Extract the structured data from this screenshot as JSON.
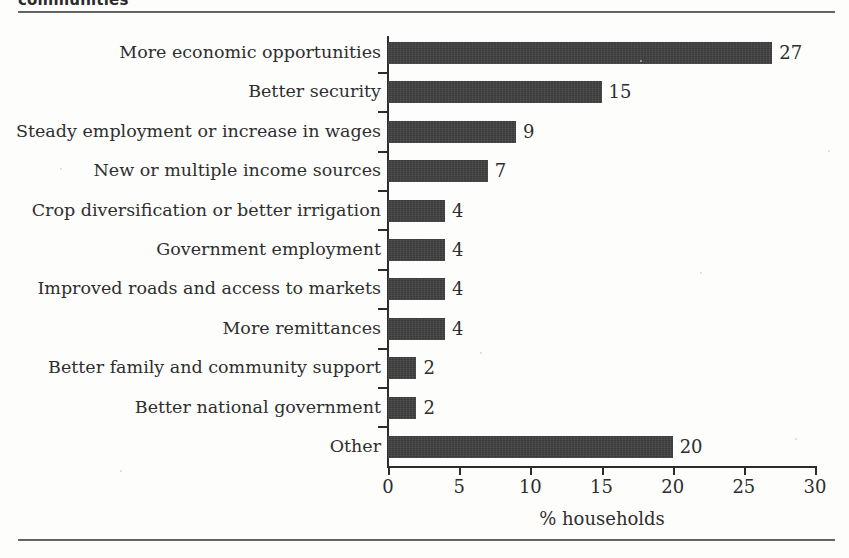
{
  "caption": {
    "text_cropped": "communities"
  },
  "chart_data": {
    "type": "bar",
    "orientation": "horizontal",
    "title": "",
    "subtitle": "",
    "xlabel": "% households",
    "ylabel": "",
    "xlim": [
      0,
      30
    ],
    "xticks": [
      0,
      5,
      10,
      15,
      20,
      25,
      30
    ],
    "xticklabels": [
      "0",
      "5",
      "10",
      "15",
      "20",
      "25",
      "30"
    ],
    "grid": false,
    "legend": null,
    "bar_color": "#3b3b3b",
    "text_color": "#2e2e2e",
    "value_labels_shown": true,
    "categories": [
      "More economic opportunities",
      "Better security",
      "Steady employment or increase in wages",
      "New or multiple income sources",
      "Crop diversification or better irrigation",
      "Government employment",
      "Improved roads and access to markets",
      "More remittances",
      "Better family and community support",
      "Better national government",
      "Other"
    ],
    "values": [
      27,
      15,
      9,
      7,
      4,
      4,
      4,
      4,
      2,
      2,
      20
    ],
    "value_labels": [
      "27",
      "15",
      "9",
      "7",
      "4",
      "4",
      "4",
      "4",
      "2",
      "2",
      "20"
    ]
  }
}
